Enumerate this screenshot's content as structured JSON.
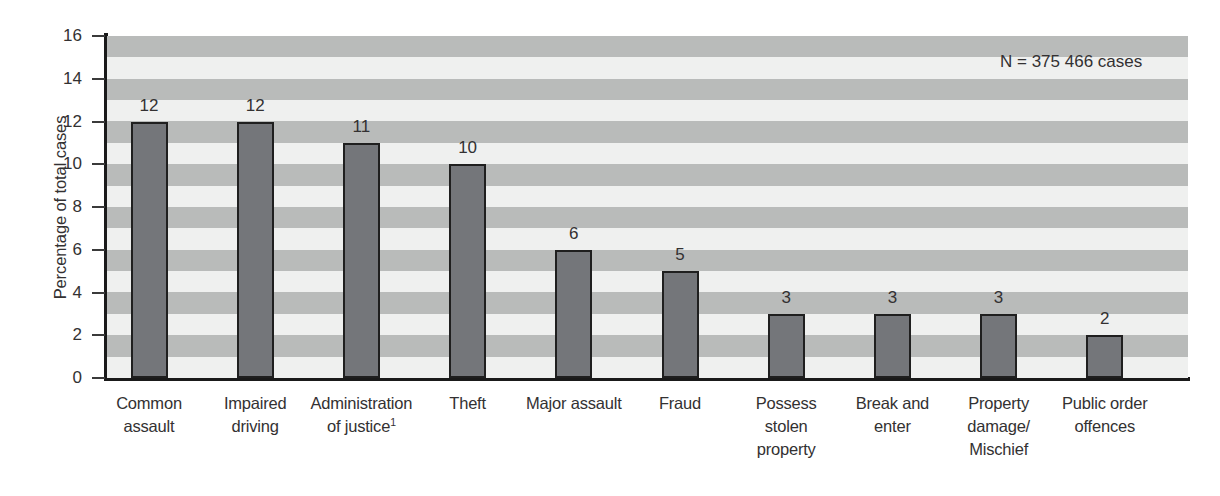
{
  "chart_data": {
    "type": "bar",
    "title": "",
    "subtitle": "",
    "xlabel": "",
    "ylabel": "Percentage of total cases",
    "ylim": [
      0,
      16
    ],
    "ytick_values": [
      0,
      2,
      4,
      6,
      8,
      10,
      12,
      14,
      16
    ],
    "ytick_labels": [
      "0",
      "2",
      "4",
      "6",
      "8",
      "10",
      "12",
      "14",
      "16"
    ],
    "grid": "horizontal-alternating-bands",
    "legend": "none",
    "categories": [
      "Common assault",
      "Impaired driving",
      "Administration of justice",
      "Theft",
      "Major assault",
      "Fraud",
      "Possess stolen property",
      "Break and enter",
      "Property damage/ Mischief",
      "Public order offences"
    ],
    "category_lines": [
      [
        "Common",
        "assault"
      ],
      [
        "Impaired",
        "driving"
      ],
      [
        "Administration",
        "of justice"
      ],
      [
        "Theft"
      ],
      [
        "Major assault"
      ],
      [
        "Fraud"
      ],
      [
        "Possess",
        "stolen",
        "property"
      ],
      [
        "Break and",
        "enter"
      ],
      [
        "Property",
        "damage/",
        "Mischief"
      ],
      [
        "Public order",
        "offences"
      ]
    ],
    "category_footnote_markers": [
      "",
      "",
      "1",
      "",
      "",
      "",
      "",
      "",
      "",
      ""
    ],
    "values": [
      12,
      12,
      11,
      10,
      6,
      5,
      3,
      3,
      3,
      2
    ],
    "value_labels": [
      "12",
      "12",
      "11",
      "10",
      "6",
      "5",
      "3",
      "3",
      "3",
      "2"
    ],
    "annotations": [
      {
        "name": "sample-size",
        "text": "N = 375 466 cases"
      }
    ],
    "colors": {
      "bar_fill": "#74767a",
      "bar_outline": "#1f1f1f",
      "band_dark": "#b9bbba",
      "band_light": "#eff0ef",
      "text": "#333132",
      "axis": "#1a1a1a"
    }
  }
}
